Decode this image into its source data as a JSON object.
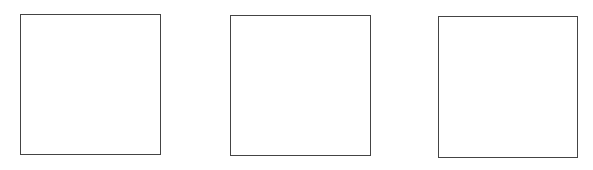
{
  "boxes": [
    {
      "id": "box-1",
      "x": 20,
      "y": 14,
      "w": 141,
      "h": 141,
      "border": "#444444"
    },
    {
      "id": "box-2",
      "x": 230,
      "y": 15,
      "w": 141,
      "h": 141,
      "border": "#444444"
    },
    {
      "id": "box-3",
      "x": 438,
      "y": 16,
      "w": 140,
      "h": 142,
      "border": "#444444"
    }
  ]
}
